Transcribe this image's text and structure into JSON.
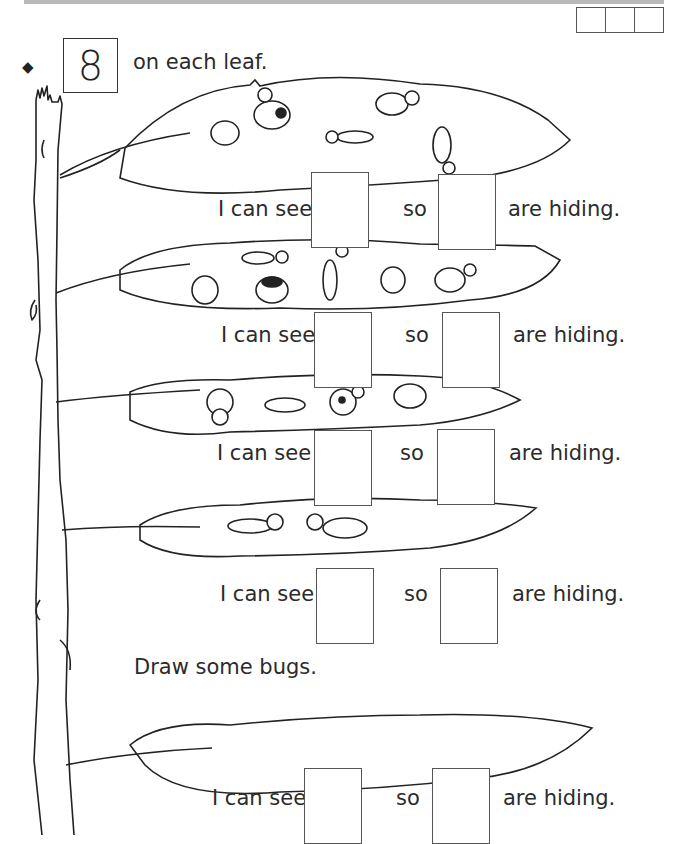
{
  "header": {
    "score_boxes": 3
  },
  "instruction": {
    "bullet_icon": "diamond",
    "number": "8",
    "text": "on each leaf."
  },
  "rows": [
    {
      "prefix": "I can see",
      "middle": "so",
      "suffix": "are hiding.",
      "bugs_visible": 5
    },
    {
      "prefix": "I can see",
      "middle": "so",
      "suffix": "are hiding.",
      "bugs_visible": 6
    },
    {
      "prefix": "I can see",
      "middle": "so",
      "suffix": "are hiding.",
      "bugs_visible": 4
    },
    {
      "prefix": "I can see",
      "middle": "so",
      "suffix": "are hiding.",
      "bugs_visible": 2
    },
    {
      "prefix": "I can see",
      "middle": "so",
      "suffix": "are hiding.",
      "bugs_visible": 0
    }
  ],
  "draw_prompt": "Draw some bugs."
}
